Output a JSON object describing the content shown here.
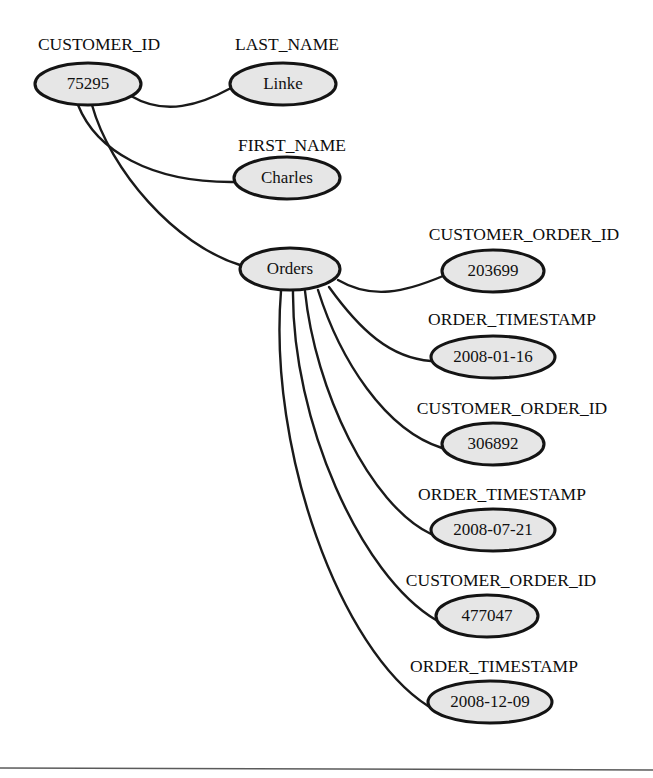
{
  "diagram": {
    "type": "tree",
    "background_color": "#ffffff",
    "node_fill_color": "#e6e6e6",
    "node_stroke_color": "#141414",
    "edge_color": "#1a1a1a",
    "divider_color": "#5a5a5a",
    "nodes": [
      {
        "id": "customer_id",
        "label": "CUSTOMER_ID",
        "value": "75295",
        "cx": 88,
        "cy": 84,
        "rx": 53,
        "ry": 21,
        "label_x": 99,
        "label_y": 46
      },
      {
        "id": "last_name",
        "label": "LAST_NAME",
        "value": "Linke",
        "cx": 283,
        "cy": 84,
        "rx": 53,
        "ry": 21,
        "label_x": 287,
        "label_y": 46
      },
      {
        "id": "first_name",
        "label": "FIRST_NAME",
        "value": "Charles",
        "cx": 287,
        "cy": 178,
        "rx": 53,
        "ry": 21,
        "label_x": 292,
        "label_y": 147
      },
      {
        "id": "orders",
        "label": "",
        "value": "Orders",
        "cx": 290,
        "cy": 269,
        "rx": 50,
        "ry": 21,
        "label_x": 290,
        "label_y": 269
      },
      {
        "id": "order_1_id",
        "label": "CUSTOMER_ORDER_ID",
        "value": "203699",
        "cx": 493,
        "cy": 271,
        "rx": 51,
        "ry": 21,
        "label_x": 524,
        "label_y": 236
      },
      {
        "id": "order_1_ts",
        "label": "ORDER_TIMESTAMP",
        "value": "2008-01-16",
        "cx": 493,
        "cy": 357,
        "rx": 62,
        "ry": 21,
        "label_x": 512,
        "label_y": 321
      },
      {
        "id": "order_2_id",
        "label": "CUSTOMER_ORDER_ID",
        "value": "306892",
        "cx": 493,
        "cy": 444,
        "rx": 51,
        "ry": 21,
        "label_x": 512,
        "label_y": 410
      },
      {
        "id": "order_2_ts",
        "label": "ORDER_TIMESTAMP",
        "value": "2008-07-21",
        "cx": 493,
        "cy": 530,
        "rx": 62,
        "ry": 21,
        "label_x": 502,
        "label_y": 496
      },
      {
        "id": "order_3_id",
        "label": "CUSTOMER_ORDER_ID",
        "value": "477047",
        "cx": 487,
        "cy": 616,
        "rx": 51,
        "ry": 21,
        "label_x": 501,
        "label_y": 582
      },
      {
        "id": "order_3_ts",
        "label": "ORDER_TIMESTAMP",
        "value": "2008-12-09",
        "cx": 490,
        "cy": 702,
        "rx": 62,
        "ry": 21,
        "label_x": 494,
        "label_y": 668
      }
    ],
    "edges": [
      {
        "id": "edge-customer-lastname",
        "from": "customer_id",
        "to": "last_name",
        "path": "M 131,96 C 165,116 200,105 231,88"
      },
      {
        "id": "edge-customer-firstname",
        "from": "customer_id",
        "to": "first_name",
        "path": "M 78,105 C 96,150 150,183 235,182"
      },
      {
        "id": "edge-customer-orders",
        "from": "customer_id",
        "to": "orders",
        "path": "M 92,105 C 110,170 175,245 240,265"
      },
      {
        "id": "edge-orders-order1-id",
        "from": "orders",
        "to": "order_1_id",
        "path": "M 338,280 C 372,300 405,292 443,276"
      },
      {
        "id": "edge-orders-order1-ts",
        "from": "orders",
        "to": "order_1_ts",
        "path": "M 329,287 C 360,330 390,358 431,361"
      },
      {
        "id": "edge-orders-order2-id",
        "from": "orders",
        "to": "order_2_id",
        "path": "M 318,290 C 340,360 385,430 442,448"
      },
      {
        "id": "edge-orders-order2-ts",
        "from": "orders",
        "to": "order_2_ts",
        "path": "M 305,291 C 315,390 370,505 431,534"
      },
      {
        "id": "edge-orders-order3-id",
        "from": "orders",
        "to": "order_3_id",
        "path": "M 293,291 C 292,420 360,575 436,620"
      },
      {
        "id": "edge-orders-order3-ts",
        "from": "orders",
        "to": "order_3_ts",
        "path": "M 281,291 C 268,450 340,650 428,706"
      }
    ],
    "divider": {
      "id": "bottom-divider",
      "x1": 0,
      "y1": 768,
      "x2": 653,
      "y2": 770
    }
  }
}
